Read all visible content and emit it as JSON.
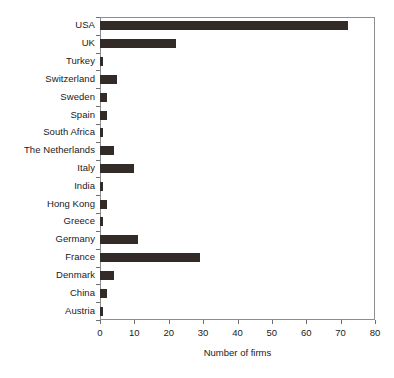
{
  "chart_data": {
    "type": "bar",
    "orientation": "horizontal",
    "title": "",
    "xlabel": "Number of firms",
    "ylabel": "",
    "xlim": [
      0,
      80
    ],
    "ylim": null,
    "xticks": [
      0,
      10,
      20,
      30,
      40,
      50,
      60,
      70,
      80
    ],
    "grid": false,
    "legend": null,
    "categories": [
      "USA",
      "UK",
      "Turkey",
      "Switzerland",
      "Sweden",
      "Spain",
      "South Africa",
      "The Netherlands",
      "Italy",
      "India",
      "Hong Kong",
      "Greece",
      "Germany",
      "France",
      "Denmark",
      "China",
      "Austria"
    ],
    "values": [
      72,
      22,
      1,
      5,
      2,
      2,
      1,
      4,
      10,
      1,
      2,
      1,
      11,
      29,
      4,
      2,
      1
    ],
    "colors": {
      "bar": "#332b28",
      "axis": "#8d8d8d",
      "tick": "#6e6e6e",
      "text": "#1a1a1a",
      "background": "#ffffff"
    }
  }
}
